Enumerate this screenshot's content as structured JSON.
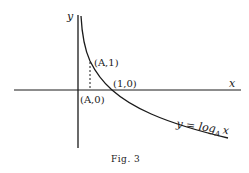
{
  "figure": {
    "caption": "Fig. 3",
    "axes": {
      "x_label": "x",
      "y_label": "y"
    },
    "points": [
      {
        "label": "(A,1)",
        "x_text": "A",
        "y_text": "1"
      },
      {
        "label": "(1,0)"
      },
      {
        "label": "(A,0)",
        "x_text": "A",
        "y_text": "0"
      }
    ],
    "curve": {
      "label_prefix": "y = log",
      "label_base": "A",
      "label_arg": "x"
    },
    "colors": {
      "ink": "#1a1a1a",
      "background": "#ffffff"
    }
  }
}
